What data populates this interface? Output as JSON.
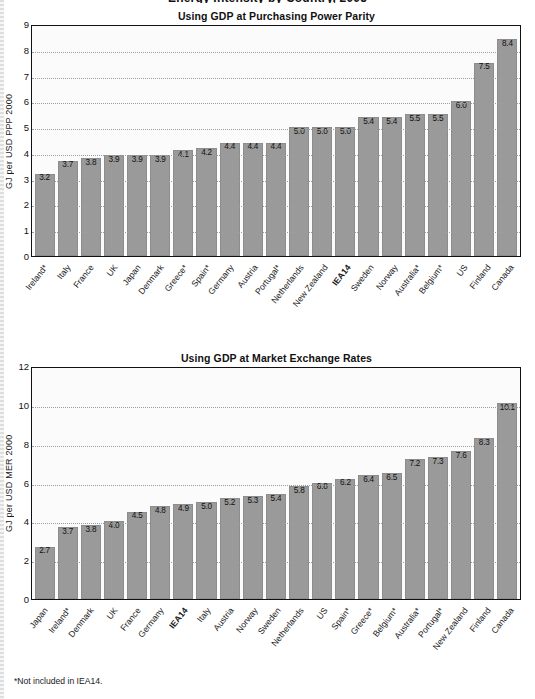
{
  "page": {
    "clipped_header": "Energy Intensity by Country, 2005",
    "footnote": "*Not included in IEA14."
  },
  "chart_data": [
    {
      "id": "ppp",
      "type": "bar",
      "title": "Using GDP at Purchasing Power Parity",
      "xlabel": "",
      "ylabel": "GJ  per USD PPP 2000",
      "ylim": [
        0,
        9
      ],
      "yticks": [
        0,
        1,
        2,
        3,
        4,
        5,
        6,
        7,
        8,
        9
      ],
      "grid": true,
      "legend": "none",
      "bar_color": "#9a9a9a",
      "highlight_category": "IEA14",
      "categories": [
        "Ireland*",
        "Italy",
        "France",
        "UK",
        "Japan",
        "Denmark",
        "Greece*",
        "Spain*",
        "Germany",
        "Austria",
        "Portugal*",
        "Netherlands",
        "New Zealand",
        "IEA14",
        "Sweden",
        "Norway",
        "Australia*",
        "Belgium*",
        "US",
        "Finland",
        "Canada"
      ],
      "values": [
        3.2,
        3.7,
        3.8,
        3.9,
        3.9,
        3.9,
        4.1,
        4.2,
        4.4,
        4.4,
        4.4,
        5.0,
        5.0,
        5.0,
        5.4,
        5.4,
        5.5,
        5.5,
        6.0,
        7.5,
        8.4
      ],
      "value_labels": [
        "3.2",
        "3.7",
        "3.8",
        "3.9",
        "3.9",
        "3.9",
        "4.1",
        "4.2",
        "4.4",
        "4.4",
        "4.4",
        "5.0",
        "5.0",
        "5.0",
        "5.4",
        "5.4",
        "5.5",
        "5.5",
        "6.0",
        "7.5",
        "8.4"
      ]
    },
    {
      "id": "mer",
      "type": "bar",
      "title": "Using GDP at Market Exchange Rates",
      "xlabel": "",
      "ylabel": "GJ  per USD MER 2000",
      "ylim": [
        0,
        12
      ],
      "yticks": [
        0,
        2,
        4,
        6,
        8,
        10,
        12
      ],
      "grid": true,
      "legend": "none",
      "bar_color": "#9a9a9a",
      "highlight_category": "IEA14",
      "categories": [
        "Japan",
        "Ireland*",
        "Denmark",
        "UK",
        "France",
        "Germany",
        "IEA14",
        "Italy",
        "Austria",
        "Norway",
        "Sweden",
        "Netherlands",
        "US",
        "Spain*",
        "Greece*",
        "Belgium*",
        "Australia*",
        "Portugal*",
        "New Zealand",
        "Finland",
        "Canada"
      ],
      "values": [
        2.7,
        3.7,
        3.8,
        4.0,
        4.5,
        4.8,
        4.9,
        5.0,
        5.2,
        5.3,
        5.4,
        5.8,
        6.0,
        6.2,
        6.4,
        6.5,
        7.2,
        7.3,
        7.6,
        8.3,
        10.1
      ],
      "value_labels": [
        "2.7",
        "3.7",
        "3.8",
        "4.0",
        "4.5",
        "4.8",
        "4.9",
        "5.0",
        "5.2",
        "5.3",
        "5.4",
        "5.8",
        "6.0",
        "6.2",
        "6.4",
        "6.5",
        "7.2",
        "7.3",
        "7.6",
        "8.3",
        "10.1"
      ]
    }
  ]
}
